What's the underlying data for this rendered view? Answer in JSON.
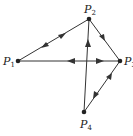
{
  "diagram": {
    "type": "directed-graph",
    "nodes": [
      {
        "id": "P1",
        "label": "P",
        "sub": "1",
        "x": 18,
        "y": 61
      },
      {
        "id": "P2",
        "label": "P",
        "sub": "2",
        "x": 89,
        "y": 19
      },
      {
        "id": "P3",
        "label": "P",
        "sub": "3",
        "x": 120,
        "y": 61
      },
      {
        "id": "P4",
        "label": "P",
        "sub": "4",
        "x": 84,
        "y": 112
      }
    ],
    "edges": [
      {
        "from": "P1",
        "to": "P2",
        "direction": "both"
      },
      {
        "from": "P2",
        "to": "P3",
        "direction": "forward"
      },
      {
        "from": "P1",
        "to": "P3",
        "direction": "both"
      },
      {
        "from": "P4",
        "to": "P2",
        "direction": "forward"
      },
      {
        "from": "P3",
        "to": "P4",
        "direction": "both"
      }
    ],
    "colors": {
      "line": "#333333",
      "node": "#222222"
    }
  }
}
